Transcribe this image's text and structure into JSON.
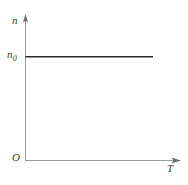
{
  "chart_data": {
    "type": "line",
    "title": "",
    "subtitle": "",
    "xlabel": "T",
    "ylabel": "n",
    "series": [
      {
        "name": "n(T)",
        "x": [
          0,
          1
        ],
        "values": [
          1,
          1
        ],
        "style": "solid",
        "color": "#2b2b2b",
        "description": "horizontal constant line at n = n0"
      }
    ],
    "annotations": [
      {
        "text": "n0",
        "role": "y-axis-tick-label",
        "value": "n₀"
      },
      {
        "text": "O",
        "role": "origin-label"
      }
    ],
    "xticks": [],
    "yticks": [
      "n₀"
    ],
    "xlim": [
      0,
      1.2
    ],
    "ylim": [
      0,
      1.35
    ],
    "grid": false,
    "legend": false,
    "legend_position": "none",
    "axis_arrows": true
  },
  "labels": {
    "y_axis": "n",
    "x_axis": "T",
    "origin": "O",
    "y_tick_base": "n",
    "y_tick_sub": "0"
  },
  "colors": {
    "background": "#ffffff",
    "axis": "#9a9a9a",
    "data_line": "#2b2b2b",
    "text": "#3a3a3a"
  }
}
